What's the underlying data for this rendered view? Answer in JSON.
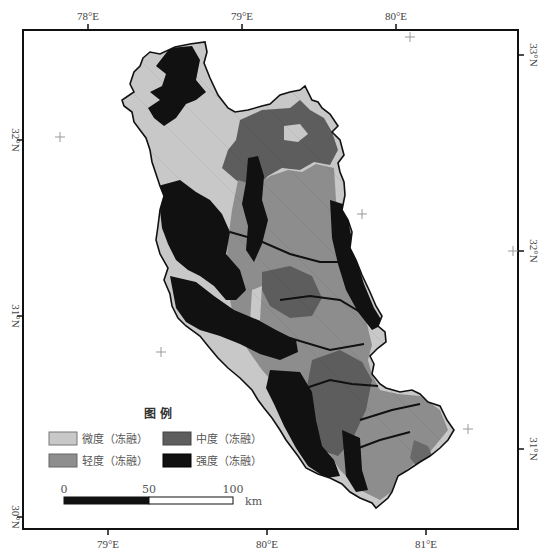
{
  "map": {
    "title": "",
    "frame": {
      "x": 23,
      "y": 30,
      "width": 495,
      "height": 499
    },
    "lon_ticks_top": [
      {
        "label": "78°E",
        "x": 88
      },
      {
        "label": "79°E",
        "x": 242
      },
      {
        "label": "80°E",
        "x": 396
      }
    ],
    "lon_ticks_bottom": [
      {
        "label": "79°E",
        "x": 108
      },
      {
        "label": "80°E",
        "x": 267
      },
      {
        "label": "81°E",
        "x": 426
      }
    ],
    "lat_ticks_left": [
      {
        "label": "32°N",
        "y": 140
      },
      {
        "label": "31°N",
        "y": 316
      },
      {
        "label": "30°N",
        "y": 517
      }
    ],
    "lat_ticks_right": [
      {
        "label": "33°N",
        "y": 55
      },
      {
        "label": "32°N",
        "y": 251
      },
      {
        "label": "31°N",
        "y": 449
      }
    ],
    "graticule_crosses": [
      {
        "x": 60,
        "y": 137
      },
      {
        "x": 410,
        "y": 37
      },
      {
        "x": 362,
        "y": 214
      },
      {
        "x": 513,
        "y": 251
      },
      {
        "x": 161,
        "y": 352
      },
      {
        "x": 468,
        "y": 429
      }
    ]
  },
  "legend": {
    "title": "图  例",
    "items": [
      {
        "label": "微度（冻融）",
        "color": "#c8c8c8",
        "name": "slight"
      },
      {
        "label": "中度（冻融）",
        "color": "#5e5e5e",
        "name": "moderate"
      },
      {
        "label": "轻度（冻融）",
        "color": "#8e8e8e",
        "name": "light"
      },
      {
        "label": "强度（冻融）",
        "color": "#111111",
        "name": "severe"
      }
    ]
  },
  "scale_bar": {
    "labels": [
      "0",
      "50",
      "100"
    ],
    "unit": "km"
  },
  "colors": {
    "slight": "#c8c8c8",
    "light": "#8e8e8e",
    "moderate": "#5e5e5e",
    "severe": "#111111",
    "outline": "#111111",
    "frame": "#111111"
  }
}
